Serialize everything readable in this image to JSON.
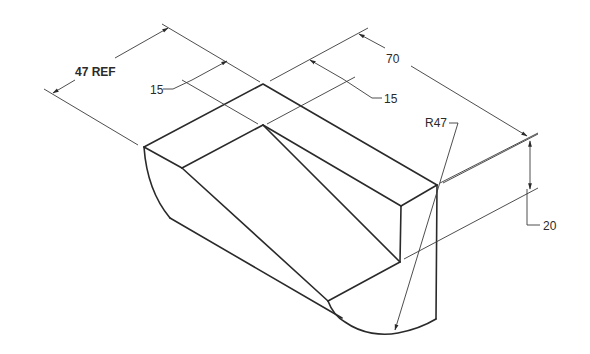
{
  "drawing": {
    "type": "isometric technical drawing",
    "dimensions": {
      "overall_width": "47 REF",
      "left_offset": "15",
      "length": "70",
      "right_offset": "15",
      "radius": "R47",
      "height": "20"
    },
    "colors": {
      "line": "#2a2a2a",
      "background": "#ffffff"
    }
  }
}
